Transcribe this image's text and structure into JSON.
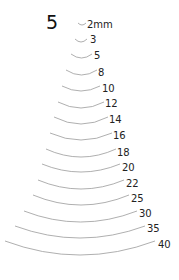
{
  "title": "5",
  "colors": {
    "arc": "#9a9a9a",
    "text": "#222222"
  },
  "sweeps": [
    {
      "label": "2mm",
      "x1": 78,
      "x2": 86,
      "y": 23,
      "depth": 2,
      "lx": 87,
      "ly": 20
    },
    {
      "label": "3",
      "x1": 75,
      "x2": 87,
      "y": 39,
      "depth": 3,
      "lx": 90,
      "ly": 35
    },
    {
      "label": "5",
      "x1": 71,
      "x2": 92,
      "y": 54,
      "depth": 4,
      "lx": 94,
      "ly": 51
    },
    {
      "label": "8",
      "x1": 66,
      "x2": 97,
      "y": 70,
      "depth": 5,
      "lx": 98,
      "ly": 68
    },
    {
      "label": "10",
      "x1": 62,
      "x2": 100,
      "y": 86,
      "depth": 5,
      "lx": 102,
      "ly": 84
    },
    {
      "label": "12",
      "x1": 58,
      "x2": 104,
      "y": 102,
      "depth": 6,
      "lx": 105,
      "ly": 99
    },
    {
      "label": "14",
      "x1": 54,
      "x2": 108,
      "y": 117,
      "depth": 7,
      "lx": 109,
      "ly": 115
    },
    {
      "label": "16",
      "x1": 50,
      "x2": 112,
      "y": 133,
      "depth": 7,
      "lx": 113,
      "ly": 131
    },
    {
      "label": "18",
      "x1": 46,
      "x2": 116,
      "y": 149,
      "depth": 8,
      "lx": 117,
      "ly": 148
    },
    {
      "label": "20",
      "x1": 42,
      "x2": 120,
      "y": 164,
      "depth": 8,
      "lx": 122,
      "ly": 163
    },
    {
      "label": "22",
      "x1": 38,
      "x2": 124,
      "y": 180,
      "depth": 9,
      "lx": 126,
      "ly": 179
    },
    {
      "label": "25",
      "x1": 33,
      "x2": 129,
      "y": 195,
      "depth": 10,
      "lx": 131,
      "ly": 194
    },
    {
      "label": "30",
      "x1": 24,
      "x2": 137,
      "y": 211,
      "depth": 11,
      "lx": 139,
      "ly": 209
    },
    {
      "label": "35",
      "x1": 15,
      "x2": 145,
      "y": 226,
      "depth": 12,
      "lx": 147,
      "ly": 224
    },
    {
      "label": "40",
      "x1": 5,
      "x2": 155,
      "y": 241,
      "depth": 14,
      "lx": 158,
      "ly": 240
    }
  ]
}
